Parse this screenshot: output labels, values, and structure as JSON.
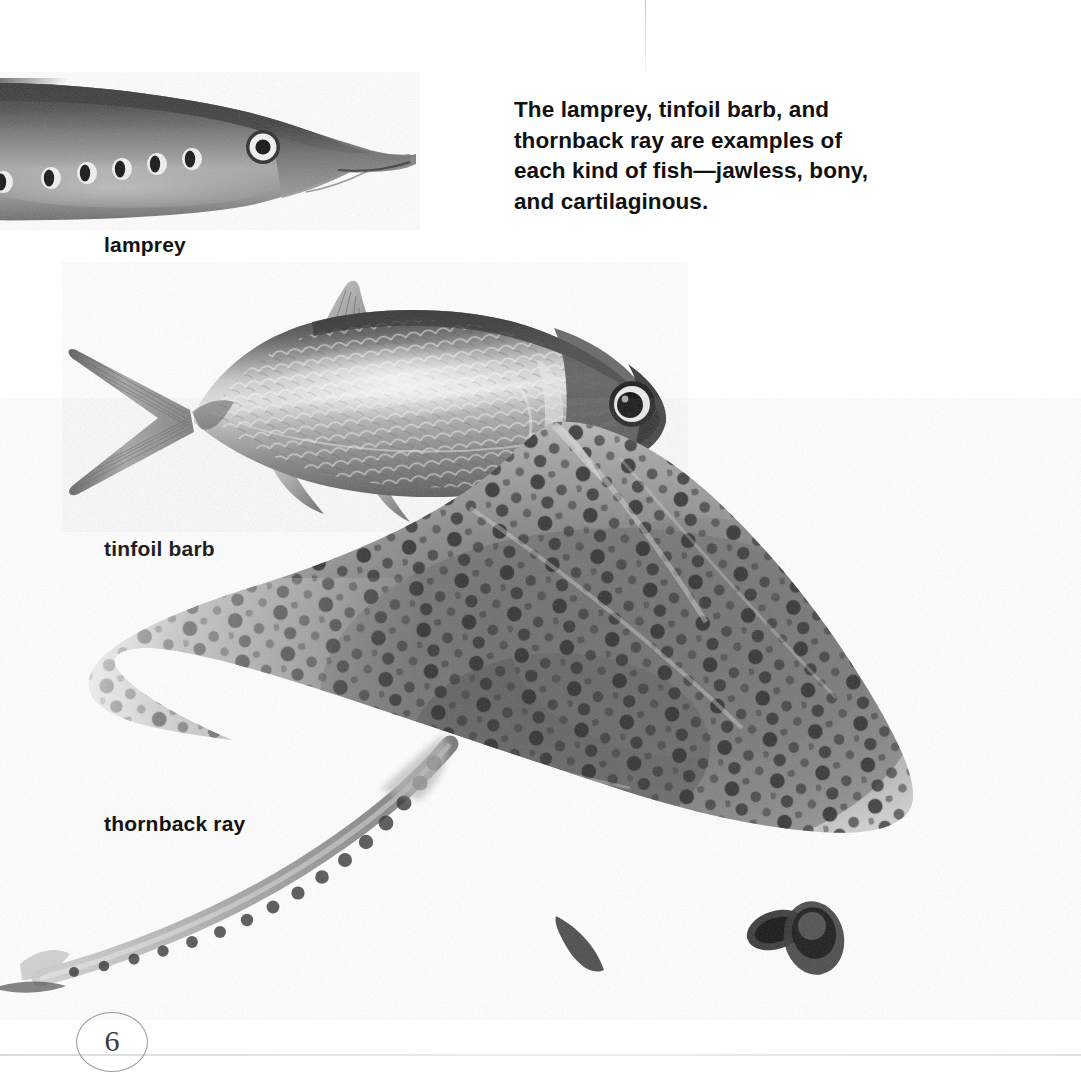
{
  "page": {
    "number": "6",
    "background_color": "#ffffff",
    "text_color": "#111111"
  },
  "caption": {
    "text": "The lamprey, tinfoil barb, and thornback ray are examples of each kind of fish—jawless, bony, and cartilaginous."
  },
  "figures": [
    {
      "id": "lamprey",
      "label": "lamprey",
      "kind": "jawless",
      "description": "black-and-white photograph of a lamprey head and forepart, showing seven round gill openings in a row and a pale-ringed eye",
      "features": {
        "gill_openings": 7,
        "eye": "pale ring with dark pupil",
        "orientation": "facing right"
      }
    },
    {
      "id": "tinfoil-barb",
      "label": "tinfoil barb",
      "kind": "bony",
      "description": "black-and-white photograph of a tinfoil barb, a deep-bodied silvery fish with a forked tail, triangular dorsal fin and large dark eye",
      "features": {
        "fins": [
          "dorsal",
          "caudal",
          "anal",
          "pelvic",
          "pectoral"
        ],
        "eye": "large dark",
        "orientation": "facing right"
      }
    },
    {
      "id": "thornback-ray",
      "label": "thornback ray",
      "kind": "cartilaginous",
      "description": "black-and-white photograph of a thornback ray seen from above, a diamond-shaped spotted body with pointed wing tips, eye and spiracle on top of the head, and a long thorny tail curving to the lower left",
      "features": {
        "eye": "dark oval",
        "spiracle": "dark oval behind eye",
        "tail": "long, lined with thorns",
        "pattern": "dark spots over grey body"
      }
    }
  ],
  "labels": {
    "lamprey": "lamprey",
    "tinfoil_barb": "tinfoil barb",
    "thornback_ray": "thornback ray"
  },
  "colors": {
    "ink": "#111111",
    "folio_ring": "#9a9a9a",
    "folio_number": "#3a3a3a",
    "paper": "#ffffff"
  }
}
